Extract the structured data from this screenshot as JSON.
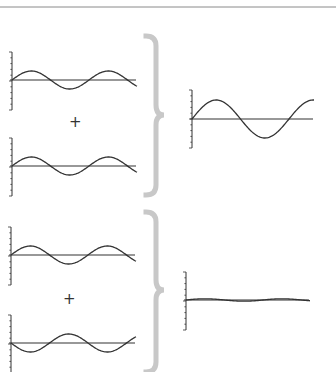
{
  "diagram": {
    "top_rule_color": "#888888",
    "brace_color": "#c8c8c8",
    "line_color": "#333333",
    "operators": {
      "top": "+",
      "bottom": "+"
    },
    "groups": [
      {
        "name": "constructive",
        "inputs": [
          {
            "name": "wave-a",
            "amplitude": 1,
            "phase": 0
          },
          {
            "name": "wave-b",
            "amplitude": 1,
            "phase": 0
          }
        ],
        "result": {
          "name": "sum-constructive",
          "amplitude": 2
        }
      },
      {
        "name": "destructive",
        "inputs": [
          {
            "name": "wave-c",
            "amplitude": 1,
            "phase": 0
          },
          {
            "name": "wave-d",
            "amplitude": 1,
            "phase": 180
          }
        ],
        "result": {
          "name": "sum-destructive",
          "amplitude": 0
        }
      }
    ]
  }
}
